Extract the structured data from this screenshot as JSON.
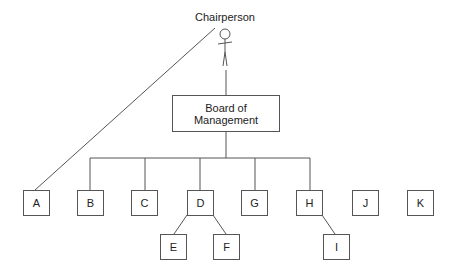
{
  "diagram": {
    "actor": {
      "label": "Chairperson"
    },
    "board": {
      "line1": "Board of",
      "line2": "Management"
    },
    "nodes": [
      {
        "id": "A",
        "label": "A"
      },
      {
        "id": "B",
        "label": "B"
      },
      {
        "id": "C",
        "label": "C"
      },
      {
        "id": "D",
        "label": "D"
      },
      {
        "id": "G",
        "label": "G"
      },
      {
        "id": "H",
        "label": "H"
      },
      {
        "id": "J",
        "label": "J"
      },
      {
        "id": "K",
        "label": "K"
      },
      {
        "id": "E",
        "label": "E"
      },
      {
        "id": "F",
        "label": "F"
      },
      {
        "id": "I",
        "label": "I"
      }
    ],
    "edges": [
      [
        "Chairperson",
        "A"
      ],
      [
        "Chairperson",
        "Board"
      ],
      [
        "Board",
        "B"
      ],
      [
        "Board",
        "C"
      ],
      [
        "Board",
        "D"
      ],
      [
        "Board",
        "G"
      ],
      [
        "Board",
        "H"
      ],
      [
        "D",
        "E"
      ],
      [
        "D",
        "F"
      ],
      [
        "H",
        "I"
      ]
    ],
    "line_color": "#555555"
  }
}
